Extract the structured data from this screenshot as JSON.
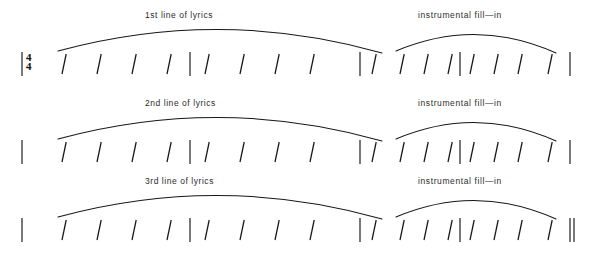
{
  "document": {
    "title": "Rhythm / chord chart with slash notation",
    "background_color": "#ffffff",
    "ink_color": "#161616"
  },
  "time_signature": {
    "numerator": "4",
    "denominator": "4",
    "display": "4/4"
  },
  "systems": [
    {
      "id": "system-1",
      "starts_with": "time-signature",
      "ends_with": "barline",
      "labels": {
        "lyrics": "1st line of lyrics",
        "fill": "instrumental  fill—in"
      },
      "arcs": [
        {
          "name": "lyrics-phrase-arc",
          "x1": 58,
          "x2": 382,
          "peak_rise": 22
        },
        {
          "name": "fill-phrase-arc",
          "x1": 396,
          "x2": 556,
          "peak_rise": 17
        }
      ],
      "measures": [
        {
          "name": "lyrics-measure-1",
          "beats": 4
        },
        {
          "name": "lyrics-measure-2",
          "beats": 4
        },
        {
          "name": "fill-measure-1",
          "beats": 4
        },
        {
          "name": "fill-measure-2",
          "beats": 4
        }
      ]
    },
    {
      "id": "system-2",
      "starts_with": "barline",
      "ends_with": "barline",
      "labels": {
        "lyrics": "2nd line of lyrics",
        "fill": "instrumental  fill—in"
      },
      "arcs": [
        {
          "name": "lyrics-phrase-arc",
          "x1": 58,
          "x2": 382,
          "peak_rise": 22
        },
        {
          "name": "fill-phrase-arc",
          "x1": 396,
          "x2": 556,
          "peak_rise": 17
        }
      ],
      "measures": [
        {
          "name": "lyrics-measure-1",
          "beats": 4
        },
        {
          "name": "lyrics-measure-2",
          "beats": 4
        },
        {
          "name": "fill-measure-1",
          "beats": 4
        },
        {
          "name": "fill-measure-2",
          "beats": 4
        }
      ]
    },
    {
      "id": "system-3",
      "starts_with": "barline",
      "ends_with": "double-barline",
      "labels": {
        "lyrics": "3rd line of lyrics",
        "fill": "instrumental  fill—in"
      },
      "arcs": [
        {
          "name": "lyrics-phrase-arc",
          "x1": 58,
          "x2": 382,
          "peak_rise": 22
        },
        {
          "name": "fill-phrase-arc",
          "x1": 396,
          "x2": 556,
          "peak_rise": 17
        }
      ],
      "measures": [
        {
          "name": "lyrics-measure-1",
          "beats": 4
        },
        {
          "name": "lyrics-measure-2",
          "beats": 4
        },
        {
          "name": "fill-measure-1",
          "beats": 4
        },
        {
          "name": "fill-measure-2",
          "beats": 4
        }
      ]
    }
  ],
  "geometry": {
    "slash_positions_lyrics": [
      [
        62,
        97,
        132,
        167
      ],
      [
        205,
        240,
        275,
        310
      ]
    ],
    "slash_positions_fill": [
      [
        372,
        400,
        424,
        448
      ],
      [
        470,
        494,
        518,
        548
      ]
    ],
    "barline_positions": {
      "lyrics_start": 22,
      "lyrics_mid": 190,
      "lyrics_end": 360,
      "fill_mid": 460,
      "fill_end": 570
    },
    "label_positions": {
      "lyrics_x": 145,
      "fill_x": 418
    }
  },
  "legend": {
    "slash_meaning": "one beat",
    "barline_meaning": "measure division"
  }
}
